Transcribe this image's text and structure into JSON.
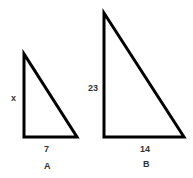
{
  "diagram": {
    "triangles": [
      {
        "name": "A",
        "vertical_side_label": "x",
        "base_label": "7",
        "caption": "A"
      },
      {
        "name": "B",
        "vertical_side_label": "23",
        "base_label": "14",
        "caption": "B"
      }
    ],
    "stroke_color": "#000000"
  }
}
